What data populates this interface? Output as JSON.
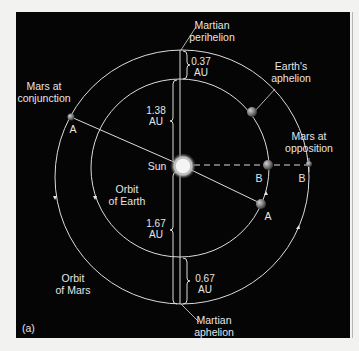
{
  "figure": {
    "panel_label": "(a)",
    "colors": {
      "background": "#050505",
      "page": "#f2f2f0",
      "line": "#e0e0e0",
      "text": "#e6e6e6",
      "sun": "#f4f4f4",
      "planet": "#8a8a8a"
    },
    "sun": {
      "label": "Sun"
    },
    "orbits": {
      "earth": {
        "label_line1": "Orbit",
        "label_line2": "of Earth"
      },
      "mars": {
        "label_line1": "Orbit",
        "label_line2": "of Mars"
      }
    },
    "annotations": {
      "martian_perihelion": {
        "line1": "Martian",
        "line2": "perihelion"
      },
      "martian_aphelion": {
        "line1": "Martian",
        "line2": "aphelion"
      },
      "earths_aphelion": {
        "line1": "Earth's",
        "line2": "aphelion"
      },
      "mars_conjunction": {
        "line1": "Mars at",
        "line2": "conjunction"
      },
      "mars_opposition": {
        "line1": "Mars at",
        "line2": "opposition"
      }
    },
    "distances": {
      "perihelion_gap": {
        "value": "0.37",
        "unit": "AU"
      },
      "sun_to_earth_top": {
        "value": "1.38",
        "unit": "AU"
      },
      "sun_to_mars_bottom": {
        "value": "1.67",
        "unit": "AU"
      },
      "aphelion_gap": {
        "value": "0.67",
        "unit": "AU"
      }
    },
    "positions": {
      "mars_A": "A",
      "earth_A": "A",
      "earth_B": "B",
      "mars_B": "B"
    }
  }
}
